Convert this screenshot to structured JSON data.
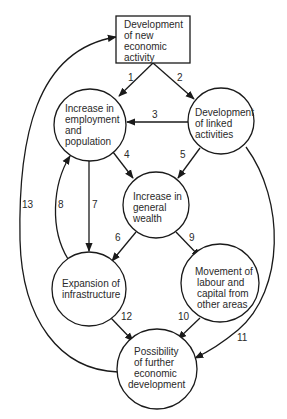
{
  "diagram": {
    "type": "flow-cycle",
    "colors": {
      "stroke": "#1a1a1a",
      "text": "#2a2a2a",
      "background": "#ffffff"
    },
    "nodes": [
      {
        "id": "new_activity",
        "shape": "rect",
        "lines": [
          "Development",
          "of new",
          "economic",
          "activity"
        ]
      },
      {
        "id": "employment",
        "shape": "circle",
        "lines": [
          "Increase in",
          "employment",
          "and",
          "population"
        ]
      },
      {
        "id": "linked",
        "shape": "circle",
        "lines": [
          "Development",
          "of linked",
          "activities"
        ]
      },
      {
        "id": "wealth",
        "shape": "circle",
        "lines": [
          "Increase in",
          "general",
          "wealth"
        ]
      },
      {
        "id": "infrastructure",
        "shape": "circle",
        "lines": [
          "Expansion of",
          "infrastructure"
        ]
      },
      {
        "id": "movement",
        "shape": "circle",
        "lines": [
          "Movement of",
          "labour and",
          "capital from",
          "other areas"
        ]
      },
      {
        "id": "further",
        "shape": "circle",
        "lines": [
          "Possibility",
          "of further",
          "economic",
          "development"
        ]
      }
    ],
    "edges": [
      {
        "label": "1",
        "from": "new_activity",
        "to": "employment"
      },
      {
        "label": "2",
        "from": "new_activity",
        "to": "linked"
      },
      {
        "label": "3",
        "from": "linked",
        "to": "employment"
      },
      {
        "label": "4",
        "from": "employment",
        "to": "wealth"
      },
      {
        "label": "5",
        "from": "linked",
        "to": "wealth"
      },
      {
        "label": "6",
        "from": "wealth",
        "to": "infrastructure"
      },
      {
        "label": "7",
        "from": "employment",
        "to": "infrastructure"
      },
      {
        "label": "8",
        "from": "infrastructure",
        "to": "employment"
      },
      {
        "label": "9",
        "from": "wealth",
        "to": "movement"
      },
      {
        "label": "10",
        "from": "movement",
        "to": "further"
      },
      {
        "label": "11",
        "from": "linked",
        "to": "further"
      },
      {
        "label": "12",
        "from": "infrastructure",
        "to": "further"
      },
      {
        "label": "13",
        "from": "further",
        "to": "new_activity"
      }
    ]
  }
}
